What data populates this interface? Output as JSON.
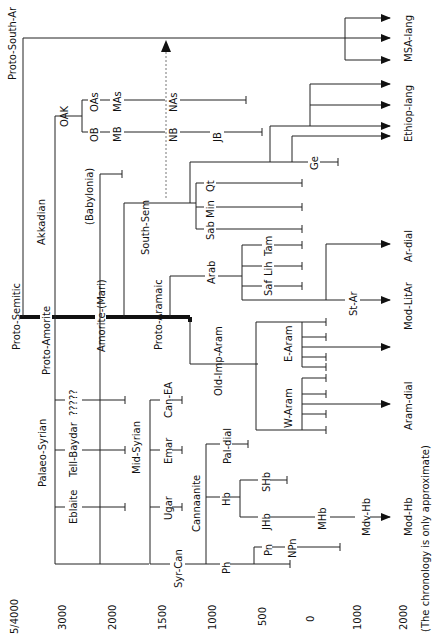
{
  "diagram": {
    "type": "language-family-tree",
    "orientation": "rotated-90-ccw",
    "root": "Proto-Semitic",
    "footnote": "(The chronology is only approximate)",
    "axis": {
      "label_top": "5/4000",
      "ticks": [
        "3000",
        "2000",
        "1500",
        "1000",
        "500",
        "0",
        "1000",
        "2000"
      ]
    },
    "nodes": {
      "proto_semitic": "Proto-Semitic",
      "proto_south_ar": "Proto-South-Ar",
      "msa_lang": "MSA-lang",
      "akkadian": "Akkadian",
      "oak": "OAK",
      "oas": "OAs",
      "mas": "MAs",
      "nas": "NAs",
      "ob": "OB",
      "mb": "MB",
      "nb": "NB",
      "jb": "JB",
      "babylonia": "(Babylonia)",
      "proto_amorite": "Proto-Amorite",
      "amorite_mari": "Amorite-(Mari)",
      "south_sem": "South-Sem",
      "qt": "Qt",
      "min": "Min",
      "sab": "Sab",
      "ge": "Ge",
      "ethiop_lang": "Ethiop-lang",
      "proto_aramaic": "Proto-Aramaic",
      "arab": "Arab",
      "saf": "Saf",
      "lih": "Lih",
      "tam": "Tam",
      "st_ar": "St-Ar",
      "ar_dial": "Ar-dial",
      "mod_litar": "Mod-LitAr",
      "old_imp_aram": "Old-Imp-Aram",
      "e_aram": "E-Aram",
      "w_aram": "W-Aram",
      "aram_dial": "Aram-dial",
      "palaeo_syrian": "Palaeo-Syrian",
      "eblaite": "Eblaite",
      "tell_baydar": "Tell-Baydar",
      "unknown": "?????",
      "mid_syrian": "Mid-Syrian",
      "ugar": "Ugar",
      "emar": "Emar",
      "can_ea": "Can-EA",
      "syr_can": "Syr-Can",
      "cannaanite": "Cannaanite",
      "ph": "Ph",
      "pn": "Pn",
      "npn": "NPn",
      "hb": "Hb",
      "pal_dial": "Pal-dial",
      "jhb": "JHb",
      "shb": "SHb",
      "mhb": "MHb",
      "mdv_hb": "Mdv-Hb",
      "mod_hb": "Mod-Hb"
    }
  }
}
